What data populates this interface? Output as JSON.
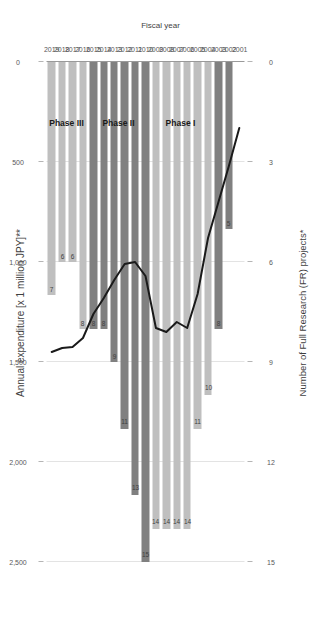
{
  "chart_data": {
    "type": "bar",
    "title": "",
    "top_axis": {
      "label": "Annual expenditure [x 1 million JPY]**",
      "ticks": [
        "2,500",
        "2,000",
        "1,500",
        "1,000",
        "500",
        "0"
      ],
      "tick_values": [
        2500,
        2000,
        1500,
        1000,
        500,
        0
      ],
      "lim": [
        0,
        2500
      ]
    },
    "bottom_axis": {
      "label": "Number of Full Research (FR) projects*",
      "ticks": [
        "15",
        "12",
        "9",
        "6",
        "3",
        "0"
      ],
      "tick_values": [
        15,
        12,
        9,
        6,
        3,
        0
      ],
      "lim": [
        0,
        15
      ]
    },
    "category_axis": {
      "label": "Fiscal year",
      "name": "Fiscal year"
    },
    "categories": [
      "2019",
      "2018",
      "2017",
      "2016",
      "2015",
      "2014",
      "2013",
      "2012",
      "2011",
      "2010",
      "2009",
      "2008",
      "2007",
      "2006",
      "2005",
      "2004",
      "2003",
      "2002",
      "2001"
    ],
    "series": [
      {
        "name": "Number of Full Research (FR) projects",
        "type": "bar",
        "values": [
          7,
          6,
          6,
          8,
          8,
          8,
          9,
          11,
          13,
          15,
          14,
          14,
          14,
          14,
          11,
          10,
          8,
          5,
          0
        ],
        "value_labels": [
          "7",
          "6",
          "6",
          "8",
          "8",
          "8",
          "9",
          "11",
          "13",
          "15",
          "14",
          "14",
          "14",
          "14",
          "11",
          "10",
          "8",
          "5",
          ""
        ]
      },
      {
        "name": "Annual expenditure",
        "type": "line",
        "values": [
          1450,
          1430,
          1425,
          1380,
          1260,
          1180,
          1090,
          1010,
          1000,
          1070,
          1330,
          1350,
          1300,
          1330,
          1160,
          880,
          700,
          520,
          330
        ]
      }
    ],
    "phases": [
      {
        "name": "Phase III",
        "years": [
          "2016",
          "2017",
          "2018",
          "2019"
        ],
        "color": "#bfbfbf"
      },
      {
        "name": "Phase II",
        "years": [
          "2010",
          "2011",
          "2012",
          "2013",
          "2014",
          "2015"
        ],
        "color": "#808080"
      },
      {
        "name": "Phase I",
        "years": [
          "2004",
          "2005",
          "2006",
          "2007",
          "2008",
          "2009"
        ],
        "color": "#bfbfbf"
      }
    ],
    "legend": {
      "position": "none",
      "entries": []
    },
    "grid": true,
    "colors": {
      "bar_light": "#bfbfbf",
      "bar_dark": "#808080",
      "line": "#1a1a1a",
      "gridline": "#e3e3e3",
      "axis": "#9a9a9a",
      "text": "#3f3f3f"
    }
  }
}
